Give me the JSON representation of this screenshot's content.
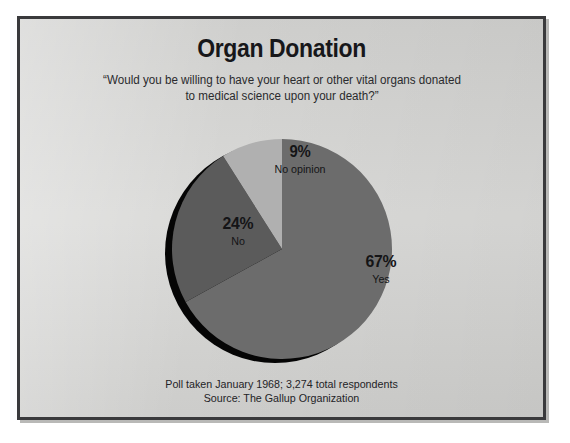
{
  "chart_data": {
    "type": "pie",
    "title": "Organ Donation",
    "subtitle_line1": "“Would you be willing to have your heart or other vital organs donated",
    "subtitle_line2": "to medical science upon your death?”",
    "categories": [
      "Yes",
      "No",
      "No opinion"
    ],
    "values": [
      67,
      24,
      9
    ],
    "value_labels": [
      "67%",
      "24%",
      "9%"
    ],
    "slice_colors": [
      "#6c6c6c",
      "#5b5b5b",
      "#b0b0b0"
    ],
    "shadow_color": "#050505",
    "start_angle_deg": 0,
    "direction": "clockwise",
    "legend": "none (labels placed on slices)",
    "grid": false,
    "xlabel": "",
    "ylabel": "",
    "footnote_line1": "Poll taken January 1968; 3,274 total respondents",
    "footnote_line2": "Source: The Gallup Organization",
    "total_respondents": "3,274",
    "poll_date": "January 1968",
    "source": "The Gallup Organization"
  },
  "frame": {
    "background_color": "#d5d5d3",
    "border_color": "#3a3a3c"
  },
  "slices": [
    {
      "label": "Yes",
      "pct": "67%"
    },
    {
      "label": "No",
      "pct": "24%"
    },
    {
      "label": "No opinion",
      "pct": "9%"
    }
  ]
}
